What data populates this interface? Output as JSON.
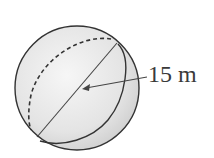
{
  "diagram": {
    "shape": "sphere",
    "measurement_label": "15 m",
    "measurement_type": "diameter",
    "colors": {
      "fill_light": "#f4f4f4",
      "fill_dark": "#d4d4d4",
      "stroke": "#333333",
      "label": "#3a3a3a"
    }
  }
}
